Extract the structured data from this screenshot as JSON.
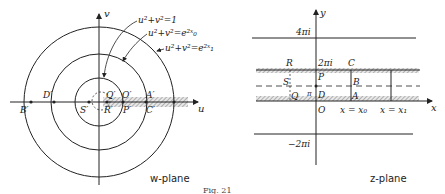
{
  "figure": {
    "caption": "Fig. 21"
  },
  "w_plane": {
    "title": "w-plane",
    "axes": {
      "horizontal": "u",
      "vertical": "v"
    },
    "curves": [
      {
        "id": "unit",
        "label": "u²+v²=1"
      },
      {
        "id": "x0",
        "label": "u²+v²=e²ˣ₀"
      },
      {
        "id": "x1",
        "label": "u²+v²=e²ˣ₁"
      }
    ],
    "points": {
      "A": "A′",
      "B": "B′",
      "C": "C′",
      "D": "D′",
      "O": "O′",
      "P": "P′",
      "Q": "Q′",
      "R": "R′",
      "S": "S′"
    }
  },
  "z_plane": {
    "title": "z-plane",
    "axes": {
      "horizontal": "x",
      "vertical": "y"
    },
    "lines": {
      "top": "4πi",
      "upper": "2πi",
      "middle": "π",
      "bottom": "−2πi"
    },
    "verticals": {
      "x0": "x = x₀",
      "x1": "x = x₁"
    },
    "points": {
      "A": "A",
      "B": "B",
      "C": "C",
      "D": "D",
      "O": "O",
      "P": "P",
      "Q": "Q",
      "R": "R",
      "S": "S"
    }
  }
}
